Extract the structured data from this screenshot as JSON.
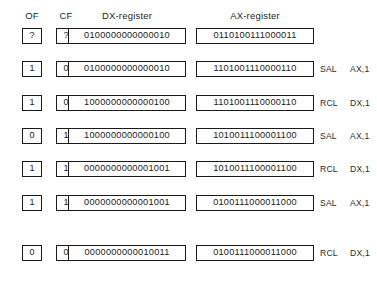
{
  "figure": {
    "headers": {
      "of": "OF",
      "cf": "CF",
      "dx": "DX-register",
      "ax": "AX-register"
    },
    "rows": [
      {
        "of": "?",
        "cf": "?",
        "dx": "0100000000000010",
        "ax": "0110100111000011",
        "mnemonic": "",
        "operand": ""
      },
      {
        "of": "1",
        "cf": "0",
        "dx": "0100000000000010",
        "ax": "1101001110000110",
        "mnemonic": "SAL",
        "operand": "AX,1"
      },
      {
        "of": "1",
        "cf": "0",
        "dx": "1000000000000100",
        "ax": "1101001110000110",
        "mnemonic": "RCL",
        "operand": "DX,1"
      },
      {
        "of": "0",
        "cf": "1",
        "dx": "1000000000000100",
        "ax": "1010011100001100",
        "mnemonic": "SAL",
        "operand": "AX,1"
      },
      {
        "of": "1",
        "cf": "1",
        "dx": "0000000000001001",
        "ax": "1010011100001100",
        "mnemonic": "RCL",
        "operand": "DX,1"
      },
      {
        "of": "1",
        "cf": "1",
        "dx": "0000000000001001",
        "ax": "0100111000011000",
        "mnemonic": "SAL",
        "operand": "AX,1"
      },
      {
        "of": "0",
        "cf": "0",
        "dx": "0000000000010011",
        "ax": "0100111000011000",
        "mnemonic": "RCL",
        "operand": "DX,1"
      }
    ]
  }
}
